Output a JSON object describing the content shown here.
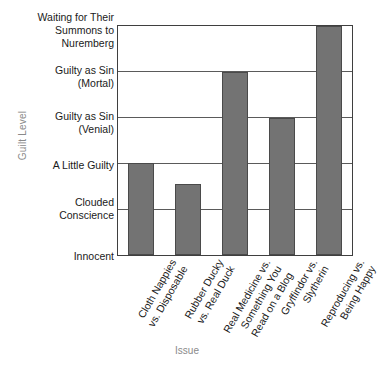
{
  "chart_data": {
    "type": "bar",
    "title": "",
    "xlabel": "Issue",
    "ylabel": "Guilt Level",
    "orientation": "vertical",
    "grid": true,
    "legend": false,
    "legend_position": "none",
    "bar_color": "#737373",
    "bar_border_color": "#4a4a4a",
    "axis_color": "#3f3f3f",
    "gridline_color": "#5a5a5a",
    "axis_title_color": "#8a8a8a",
    "tick_label_color": "#1a1a1a",
    "ylim": [
      0,
      5
    ],
    "y_tick_values": [
      0,
      1,
      2,
      3,
      4,
      5
    ],
    "y_tick_labels": [
      "Innocent",
      "Clouded\nConscience",
      "A Little Guilty",
      "Guilty as Sin\n(Venial)",
      "Guilty as Sin\n(Mortal)",
      "Waiting for Their\nSummons to\nNuremberg"
    ],
    "categories": [
      "Cloth Nappies\nvs. Disposable",
      "Rubber Ducky\nvs. Real Duck",
      "Real Medicine vs.\nSomething You\nRead on a Blog",
      "Gryffindor vs.\nSlytherin",
      "Reproducing vs.\nBeing Happy"
    ],
    "values": [
      2,
      1.55,
      4,
      3,
      5
    ],
    "value_labels": [
      "A Little Guilty",
      "Between Clouded Conscience and A Little Guilty",
      "Guilty as Sin (Mortal)",
      "Guilty as Sin (Venial)",
      "Waiting for Their Summons to Nuremberg"
    ]
  }
}
